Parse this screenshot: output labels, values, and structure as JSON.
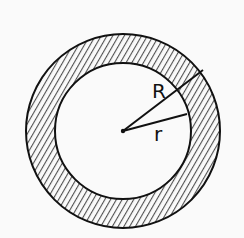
{
  "diagram": {
    "labels": {
      "outer_radius": "R",
      "inner_radius": "r"
    },
    "colors": {
      "ink": "#111111",
      "background": "#fafafa",
      "hatch": "#333333"
    }
  }
}
